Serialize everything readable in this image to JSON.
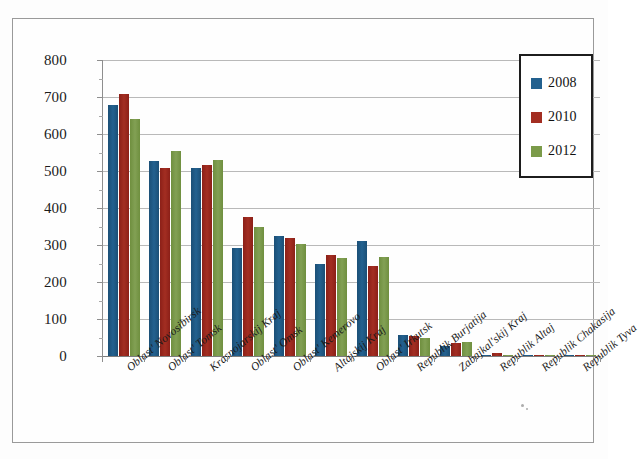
{
  "chart_data": {
    "type": "bar",
    "title": "",
    "subtitle": "",
    "xlabel": "",
    "ylabel": "",
    "ylim": [
      0,
      800
    ],
    "ytick_step": 100,
    "yticks": [
      "0",
      "100",
      "200",
      "300",
      "400",
      "500",
      "600",
      "700",
      "800"
    ],
    "grid": true,
    "legend_position": "top-right",
    "categories": [
      "Oblast' Novosibirsk",
      "Oblast' Tomsk",
      "Krasnojarskij Kraj",
      "Oblast' Omsk",
      "Oblast' Kemerovo",
      "Altajskij Kraj",
      "Oblast' Irkutsk",
      "Republik Burjatija",
      "Zabajkal'skij Kraj",
      "Republik Altaj",
      "Republik Chakasija",
      "Republik Tyva"
    ],
    "series": [
      {
        "name": "2008",
        "color": "#23618f",
        "values": [
          678,
          528,
          509,
          291,
          325,
          249,
          311,
          57,
          27,
          4,
          4,
          2
        ]
      },
      {
        "name": "2010",
        "color": "#a32e22",
        "values": [
          707,
          507,
          516,
          375,
          318,
          274,
          243,
          53,
          34,
          8,
          3,
          2
        ]
      },
      {
        "name": "2012",
        "color": "#7b9b4a",
        "values": [
          640,
          553,
          529,
          350,
          303,
          265,
          268,
          50,
          37,
          4,
          2,
          1
        ]
      }
    ]
  },
  "legend": {
    "items": [
      {
        "label": "2008",
        "color": "#23618f"
      },
      {
        "label": "2010",
        "color": "#a32e22"
      },
      {
        "label": "2012",
        "color": "#7b9b4a"
      }
    ]
  }
}
